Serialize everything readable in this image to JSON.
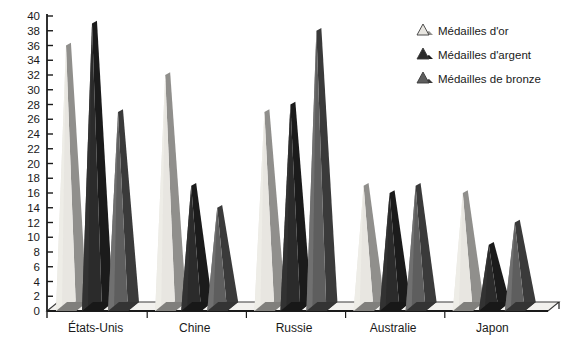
{
  "chart_data": {
    "type": "bar",
    "title": "",
    "subtitle": "",
    "xlabel": "",
    "ylabel": "",
    "categories": [
      "États-Unis",
      "Chine",
      "Russie",
      "Australie",
      "Japon"
    ],
    "series": [
      {
        "name": "Médailles d'or",
        "color": "#e8e6e1",
        "values": [
          36,
          32,
          27,
          17,
          16
        ]
      },
      {
        "name": "Médailles d'argent",
        "color": "#2b2b2b",
        "values": [
          39,
          17,
          28,
          16,
          9
        ]
      },
      {
        "name": "Médailles de bronze",
        "color": "#5e5e5e",
        "values": [
          27,
          14,
          38,
          17,
          12
        ]
      }
    ],
    "ylim": [
      0,
      40
    ],
    "yticks": [
      0,
      2,
      4,
      6,
      8,
      10,
      12,
      14,
      16,
      18,
      20,
      22,
      24,
      26,
      28,
      30,
      32,
      34,
      36,
      38,
      40
    ],
    "ytick_labels": [
      "0",
      "2",
      "4",
      "6",
      "8",
      "10",
      "12",
      "14",
      "16",
      "18",
      "20",
      "22",
      "24",
      "26",
      "28",
      "30",
      "32",
      "34",
      "36",
      "38",
      "40"
    ],
    "grid": false,
    "legend_position": "top-right",
    "marker_shape": "triangle",
    "axis_color": "#1a1a1a",
    "background": "#ffffff"
  },
  "legend": {
    "items": [
      {
        "label": "Médailles d'or",
        "icon": "triangle-icon",
        "color": "#e8e6e1"
      },
      {
        "label": "Médailles d'argent",
        "icon": "triangle-icon",
        "color": "#2b2b2b"
      },
      {
        "label": "Médailles de bronze",
        "icon": "triangle-icon",
        "color": "#5e5e5e"
      }
    ]
  }
}
